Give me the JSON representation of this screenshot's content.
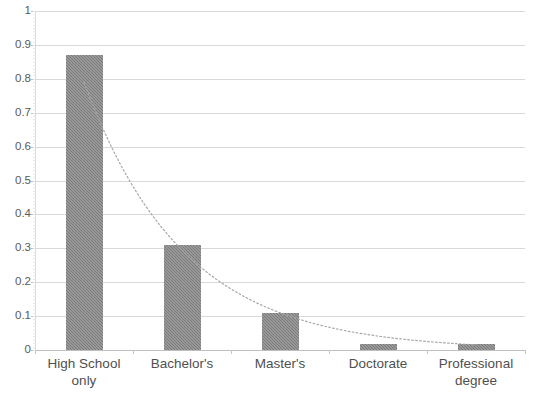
{
  "chart_data": {
    "type": "bar",
    "title": "",
    "subtitle": "",
    "xlabel": "",
    "ylabel": "",
    "categories": [
      "High School\nonly",
      "Bachelor's",
      "Master's",
      "Doctorate",
      "Professional degree"
    ],
    "values": [
      0.87,
      0.31,
      0.11,
      0.017,
      0.017
    ],
    "series": [
      {
        "name": "Share",
        "values": [
          0.87,
          0.31,
          0.11,
          0.017,
          0.017
        ]
      },
      {
        "name": "Trendline (exponential fit, dotted)",
        "type": "line",
        "style": "dotted",
        "values": [
          0.79,
          0.3,
          0.11,
          0.035,
          0.013
        ]
      }
    ],
    "ylim": [
      0,
      1
    ],
    "ytick_labels": [
      "1",
      "0.9",
      "0.8",
      "0.7",
      "0.6",
      "0.5",
      "0.4",
      "0.3",
      "0.2",
      "0.1",
      "0"
    ],
    "ytick_values": [
      1,
      0.9,
      0.8,
      0.7,
      0.6,
      0.5,
      0.4,
      0.3,
      0.2,
      0.1,
      0
    ],
    "grid": "horizontal",
    "legend": "none",
    "legend_position": "none",
    "annotations": [],
    "bar_color": "#7b7b7b",
    "gridline_color": "#d9d9d9",
    "trendline_color": "#a6a6a6"
  }
}
